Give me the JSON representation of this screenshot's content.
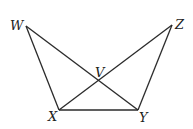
{
  "diagram": {
    "points": {
      "W": {
        "label": "W",
        "x": 26,
        "y": 26,
        "lx": 10,
        "ly": 30
      },
      "Z": {
        "label": "Z",
        "x": 172,
        "y": 25,
        "lx": 175,
        "ly": 29
      },
      "V": {
        "label": "V",
        "x": 99,
        "y": 80,
        "lx": 95,
        "ly": 77
      },
      "X": {
        "label": "X",
        "x": 59,
        "y": 110,
        "lx": 48,
        "ly": 121
      },
      "Y": {
        "label": "Y",
        "x": 138,
        "y": 110,
        "lx": 139,
        "ly": 122
      }
    },
    "segments": [
      [
        "W",
        "X"
      ],
      [
        "W",
        "Y"
      ],
      [
        "Z",
        "X"
      ],
      [
        "Z",
        "Y"
      ],
      [
        "X",
        "Y"
      ]
    ]
  }
}
